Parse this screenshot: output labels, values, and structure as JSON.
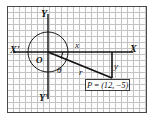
{
  "figure": {
    "background_color": "#ffffff",
    "frame_color": "#4a4a4a",
    "grid_color": "#b9b9b9",
    "ink_color": "#121212"
  },
  "axes": {
    "x_positive_label": "X",
    "x_negative_label": "X'",
    "y_positive_label": "Y",
    "y_negative_label": "Y'",
    "origin_label": "O"
  },
  "annotations": {
    "horizontal_leg_label": "x",
    "vertical_leg_label": "y",
    "radius_label": "r",
    "angle_label": "θ"
  },
  "point": {
    "label": "P = (12, −5)",
    "name": "P",
    "x_value": "12",
    "y_value": "−5"
  },
  "geometry": {
    "origin_px": [
      48,
      52
    ],
    "point_px": [
      112,
      78
    ],
    "circle_radius_px": 20
  }
}
